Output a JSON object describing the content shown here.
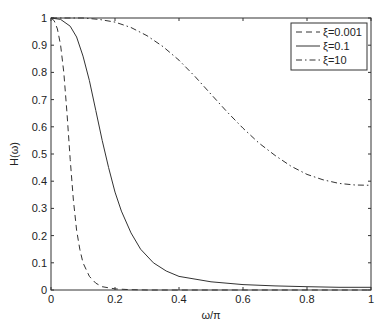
{
  "chart_data": {
    "type": "line",
    "title": "",
    "xlabel": "ω/π",
    "ylabel": "H(ω)",
    "xlim": [
      0,
      1
    ],
    "ylim": [
      0,
      1
    ],
    "grid": false,
    "legend_position": "upper right",
    "xticks": [
      "0",
      "0.2",
      "0.4",
      "0.6",
      "0.8",
      "1"
    ],
    "yticks": [
      "0",
      "0.1",
      "0.2",
      "0.3",
      "0.4",
      "0.5",
      "0.6",
      "0.7",
      "0.8",
      "0.9",
      "1"
    ],
    "series": [
      {
        "name": "ξ=0.001",
        "style": "dashed",
        "x": [
          0,
          0.01,
          0.02,
          0.03,
          0.04,
          0.05,
          0.06,
          0.07,
          0.08,
          0.09,
          0.1,
          0.12,
          0.14,
          0.16,
          0.2,
          0.25,
          0.3,
          1
        ],
        "values": [
          1,
          0.99,
          0.96,
          0.9,
          0.8,
          0.65,
          0.48,
          0.33,
          0.22,
          0.15,
          0.1,
          0.05,
          0.025,
          0.012,
          0.004,
          0.001,
          0,
          0
        ]
      },
      {
        "name": "ξ=0.1",
        "style": "solid",
        "x": [
          0,
          0.03,
          0.06,
          0.08,
          0.1,
          0.12,
          0.14,
          0.16,
          0.18,
          0.2,
          0.22,
          0.25,
          0.28,
          0.32,
          0.36,
          0.4,
          0.5,
          0.6,
          0.7,
          0.8,
          0.9,
          1
        ],
        "values": [
          1,
          0.995,
          0.97,
          0.93,
          0.86,
          0.77,
          0.66,
          0.55,
          0.45,
          0.36,
          0.29,
          0.21,
          0.15,
          0.1,
          0.07,
          0.05,
          0.03,
          0.02,
          0.015,
          0.012,
          0.01,
          0.01
        ]
      },
      {
        "name": "ξ=10",
        "style": "dashdot",
        "x": [
          0,
          0.1,
          0.15,
          0.2,
          0.25,
          0.3,
          0.35,
          0.4,
          0.45,
          0.5,
          0.55,
          0.6,
          0.65,
          0.7,
          0.75,
          0.8,
          0.85,
          0.9,
          0.95,
          1
        ],
        "values": [
          1,
          1,
          0.995,
          0.985,
          0.965,
          0.935,
          0.895,
          0.845,
          0.785,
          0.72,
          0.655,
          0.595,
          0.54,
          0.495,
          0.455,
          0.425,
          0.405,
          0.392,
          0.386,
          0.385
        ]
      }
    ]
  }
}
